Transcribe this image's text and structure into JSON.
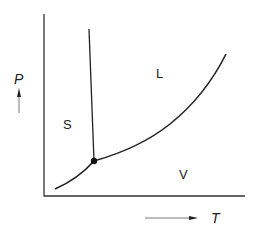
{
  "diagram": {
    "type": "phase-diagram",
    "axes": {
      "y_label": "P",
      "x_label": "T"
    },
    "regions": {
      "solid": "S",
      "liquid": "L",
      "vapor": "V"
    },
    "features": [
      "triple-point",
      "fusion-curve",
      "sublimation-curve",
      "vaporization-curve"
    ],
    "colors": {
      "line": "#222222",
      "background": "#ffffff"
    }
  }
}
